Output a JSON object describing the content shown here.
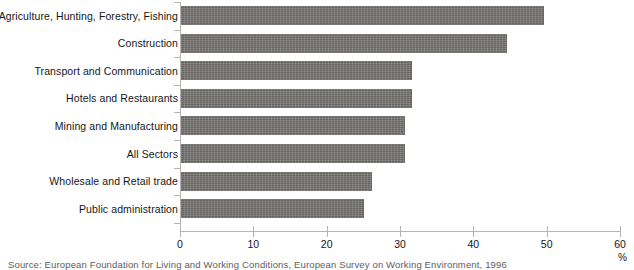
{
  "chart_data": {
    "type": "bar",
    "orientation": "horizontal",
    "title": "",
    "xlabel": "%",
    "ylabel": "",
    "xlim": [
      0,
      60
    ],
    "xticks": [
      0,
      10,
      20,
      30,
      40,
      50,
      60
    ],
    "xtick_labels": [
      "0",
      "10",
      "20",
      "30",
      "40",
      "50",
      "60"
    ],
    "grid": false,
    "legend": null,
    "bar_color": "#74726f",
    "categories": [
      "Agriculture, Hunting, Forestry, Fishing",
      "Construction",
      "Transport and Communication",
      "Hotels and Restaurants",
      "Mining and Manufacturing",
      "All Sectors",
      "Wholesale and Retail trade",
      "Public administration"
    ],
    "values": [
      49.5,
      44.5,
      31.5,
      31.5,
      30.5,
      30.5,
      26,
      25
    ]
  },
  "footer": {
    "source": "Source: European Foundation for Living and Working Conditions, European Survey on Working Environment, 1996"
  }
}
